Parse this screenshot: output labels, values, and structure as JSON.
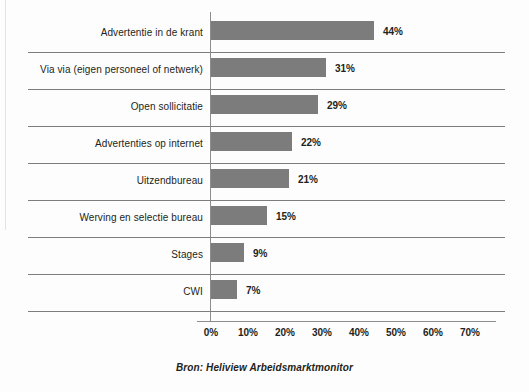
{
  "chart_data": {
    "type": "bar",
    "orientation": "horizontal",
    "title": "",
    "xlabel": "",
    "ylabel": "",
    "xlim": [
      0,
      70
    ],
    "grid": true,
    "legend": null,
    "caption": "Bron: Heliview Arbeidsmarktmonitor",
    "categories": [
      "Advertentie in de krant",
      "Via via (eigen personeel of netwerk)",
      "Open sollicitatie",
      "Advertenties op internet",
      "Uitzendbureau",
      "Werving en selectie bureau",
      "Stages",
      "CWI"
    ],
    "values": [
      44,
      31,
      29,
      22,
      21,
      15,
      9,
      7
    ],
    "value_labels": [
      "44%",
      "31%",
      "29%",
      "22%",
      "21%",
      "15%",
      "9%",
      "7%"
    ],
    "xticks": [
      0,
      10,
      20,
      30,
      40,
      50,
      60,
      70
    ],
    "xtick_labels": [
      "0%",
      "10%",
      "20%",
      "30%",
      "40%",
      "50%",
      "60%",
      "70%"
    ],
    "bar_color": "#7c7c7c",
    "gridline_color": "#7d7d7d",
    "axis_color": "#8d8d8d",
    "text_color": "#231f20",
    "background_color": "#fdfdfd"
  }
}
